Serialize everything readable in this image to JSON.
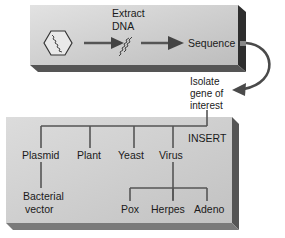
{
  "top_box": {
    "extract_label_line1": "Extract",
    "extract_label_line2": "DNA",
    "sequence_label": "Sequence",
    "icons": [
      "hexagon-cell-icon",
      "dna-strand-icon",
      "arrow-right-icon"
    ]
  },
  "connector": {
    "isolate_line1": "Isolate",
    "isolate_line2": "gene of",
    "isolate_line3": "interest"
  },
  "bottom_box": {
    "insert_label": "INSERT",
    "vectors": [
      {
        "label": "Plasmid",
        "children": [
          {
            "label_line1": "Bacterial",
            "label_line2": "vector"
          }
        ]
      },
      {
        "label": "Plant"
      },
      {
        "label": "Yeast"
      },
      {
        "label": "Virus",
        "children": [
          {
            "label": "Pox"
          },
          {
            "label": "Herpes"
          },
          {
            "label": "Adeno"
          }
        ]
      }
    ]
  },
  "colors": {
    "box_fill_top": "#d6d6d6",
    "box_fill_bottom": "#c4c4c4",
    "box_shadow": "#3a3a3a",
    "line": "#555555",
    "arrow": "#4a4a4a"
  }
}
